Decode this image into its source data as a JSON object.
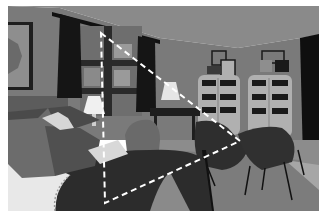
{
  "image": {
    "description": "Grayscale segmented bedroom scene with a dashed white triangle overlay",
    "colors": {
      "background": "#ffffff",
      "ceiling": "#8a8a8a",
      "wall": "#7a7a7a",
      "wall_dark": "#5c5c5c",
      "curtain": "#151515",
      "window": "#6e6e6e",
      "window_frame": "#2a2a2a",
      "painting_frame": "#1e1e1e",
      "painting": "#8e8e8e",
      "shelf": "#b0b0b0",
      "shelf_item": "#1a1a1a",
      "headboard": "#4a4a4a",
      "bed": "#2c2c2c",
      "bedspread_light": "#e8e8e8",
      "pillow_a": "#6c6c6c",
      "pillow_b": "#505050",
      "pillow_c": "#d6d6d6",
      "lamp": "#f0f0f0",
      "chair": "#2e2e2e",
      "chair_light": "#6a6a6a",
      "floor": "#8c8c8c",
      "rug": "#a6a6a6",
      "overlay": "#ffffff"
    },
    "overlay_triangle": {
      "style": "dashed",
      "vertices": [
        [
          101,
          33
        ],
        [
          240,
          141
        ],
        [
          105,
          203
        ]
      ]
    }
  }
}
